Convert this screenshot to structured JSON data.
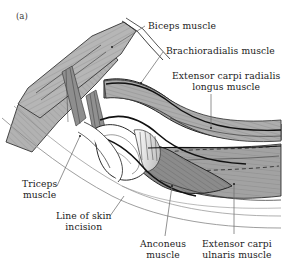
{
  "figure": {
    "panel_letter": "(a)",
    "background_color": "#ffffff",
    "ink_color": "#1c1c1c",
    "muscle_fill_light": "#b4b4b4",
    "muscle_fill_mid": "#9b9b9b",
    "muscle_fill_dark": "#828282",
    "tendon_fill": "#ffffff",
    "leader_color": "#6e6e6e",
    "striation_color": "#6a6a6a"
  },
  "labels": [
    {
      "id": "biceps",
      "name": "label-biceps-muscle",
      "lines": [
        "Biceps muscle"
      ],
      "x": 148,
      "y": 21,
      "align": "left"
    },
    {
      "id": "brachioradialis",
      "name": "label-brachioradialis-muscle",
      "lines": [
        "Brachioradialis muscle"
      ],
      "x": 166,
      "y": 46,
      "align": "left"
    },
    {
      "id": "ecrl",
      "name": "label-extensor-carpi-radialis-longus-muscle",
      "lines": [
        "Extensor carpi radialis",
        "longus muscle"
      ],
      "x": 172,
      "y": 71,
      "align": "left"
    },
    {
      "id": "triceps",
      "name": "label-triceps-muscle",
      "lines": [
        "Triceps",
        "muscle"
      ],
      "x": 22,
      "y": 179,
      "align": "left"
    },
    {
      "id": "skin-incision",
      "name": "label-line-of-skin-incision",
      "lines": [
        "Line of skin",
        "incision"
      ],
      "x": 56,
      "y": 211,
      "align": "left"
    },
    {
      "id": "anconeus",
      "name": "label-anconeus-muscle",
      "lines": [
        "Anconeus",
        "muscle"
      ],
      "x": 140,
      "y": 239,
      "align": "left"
    },
    {
      "id": "ecu",
      "name": "label-extensor-carpi-ulnaris-muscle",
      "lines": [
        "Extensor carpi",
        "ulnaris muscle"
      ],
      "x": 202,
      "y": 239,
      "align": "left"
    }
  ],
  "leaders": [
    {
      "id": "leader-biceps",
      "name": "leader-line-biceps",
      "d": "M145,26 L112,47"
    },
    {
      "id": "leader-brachioradialis",
      "name": "leader-line-brachioradialis",
      "d": "M163,52 L141,83"
    },
    {
      "id": "leader-ecrl",
      "name": "leader-line-ecrl",
      "d": "M211,94 L211,128"
    },
    {
      "id": "leader-triceps",
      "name": "leader-line-triceps",
      "d": "M57,186 L80,136"
    },
    {
      "id": "leader-skin-incision",
      "name": "leader-line-skin-incision",
      "d": "M110,216 L124,196"
    },
    {
      "id": "leader-anconeus",
      "name": "leader-line-anconeus",
      "d": "M165,236 L172,186"
    },
    {
      "id": "leader-ecu",
      "name": "leader-line-ecu",
      "d": "M234,234 L234,184"
    }
  ],
  "structures": [
    {
      "id": "triceps-belly",
      "name": "structure-triceps-muscle",
      "tone": "light"
    },
    {
      "id": "biceps-belly",
      "name": "structure-biceps-muscle",
      "tone": "light"
    },
    {
      "id": "brachioradialis",
      "name": "structure-brachioradialis-muscle",
      "tone": "mid"
    },
    {
      "id": "ecrl",
      "name": "structure-ecrl-muscle",
      "tone": "light"
    },
    {
      "id": "anconeus",
      "name": "structure-anconeus-muscle",
      "tone": "dark"
    },
    {
      "id": "ecu",
      "name": "structure-ecu-muscle",
      "tone": "mid"
    },
    {
      "id": "olecranon-tendon",
      "name": "structure-olecranon-tendon",
      "tone": "white"
    },
    {
      "id": "skin-flap-edge",
      "name": "structure-skin-incision-outline",
      "tone": "outline"
    }
  ]
}
